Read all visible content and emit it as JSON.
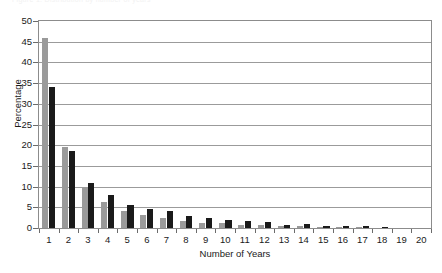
{
  "figure": {
    "top_caption": "Figure 1. Distribution by number of years"
  },
  "chart_data": {
    "type": "bar",
    "title": "",
    "subtitle": "",
    "xlabel": "Number of Years",
    "ylabel": "Percentage",
    "categories": [
      "1",
      "2",
      "3",
      "4",
      "5",
      "6",
      "7",
      "8",
      "9",
      "10",
      "11",
      "12",
      "13",
      "14",
      "15",
      "16",
      "17",
      "18",
      "19",
      "20"
    ],
    "series": [
      {
        "name": "series-gray",
        "color": "#9a9a9a",
        "values": [
          46,
          19.5,
          10,
          6.3,
          4.2,
          3.1,
          2.3,
          1.7,
          1.2,
          1.2,
          0.8,
          0.8,
          0.4,
          0.5,
          0.2,
          0.1,
          0.1,
          0,
          0,
          0
        ]
      },
      {
        "name": "series-black",
        "color": "#1a1a1a",
        "values": [
          34,
          18.5,
          10.8,
          8,
          5.5,
          4.5,
          4,
          3,
          2.5,
          2,
          1.6,
          1.5,
          0.7,
          1,
          0.4,
          0.4,
          0.4,
          0.1,
          0,
          0
        ]
      }
    ],
    "ylim": [
      0,
      50
    ],
    "yticks": [
      0,
      5,
      10,
      15,
      20,
      25,
      30,
      35,
      40,
      45,
      50
    ],
    "ytick_labels": [
      "0",
      "5",
      "10",
      "15",
      "20",
      "25",
      "30",
      "35",
      "40",
      "45",
      "50"
    ],
    "grid": "horizontal",
    "legend": "none",
    "bar_orientation": "vertical",
    "group_mode": "clustered"
  }
}
